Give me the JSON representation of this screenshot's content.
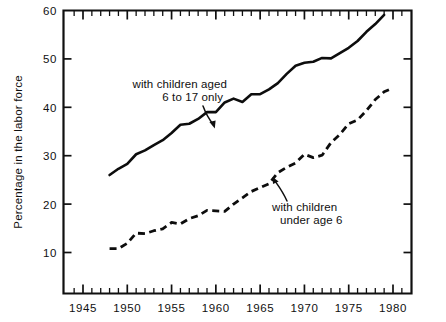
{
  "chart_data": {
    "type": "line",
    "title": "",
    "xlabel": "",
    "ylabel": "Percentage in the labor force",
    "xlim": [
      1943,
      1982
    ],
    "ylim": [
      4,
      60
    ],
    "grid": false,
    "legend_position": "inline-annotations",
    "x_ticks_major": [
      "1945",
      "1950",
      "1955",
      "1960",
      "1965",
      "1970",
      "1975",
      "1980"
    ],
    "y_ticks_major": [
      "10",
      "20",
      "30",
      "40",
      "50",
      "60"
    ],
    "x_tick_interval_minor": 1,
    "series": [
      {
        "name": "with children aged 6 to 17 only",
        "style": "solid",
        "annotation": {
          "line1": "with children aged",
          "line2": "6 to 17 only"
        },
        "x": [
          1948,
          1949,
          1950,
          1951,
          1952,
          1953,
          1954,
          1955,
          1956,
          1957,
          1958,
          1959,
          1960,
          1961,
          1962,
          1963,
          1964,
          1965,
          1966,
          1967,
          1968,
          1969,
          1970,
          1971,
          1972,
          1973,
          1974,
          1975,
          1976,
          1977,
          1978,
          1979
        ],
        "y": [
          26.0,
          27.3,
          28.3,
          30.3,
          31.1,
          32.2,
          33.2,
          34.7,
          36.4,
          36.6,
          37.6,
          39.0,
          39.0,
          41.0,
          41.8,
          41.1,
          42.7,
          42.7,
          43.7,
          45.0,
          46.9,
          48.6,
          49.2,
          49.4,
          50.2,
          50.1,
          51.2,
          52.3,
          53.7,
          55.6,
          57.2,
          59.1
        ]
      },
      {
        "name": "with children under age 6",
        "style": "dashed",
        "annotation": {
          "line1": "with children",
          "line2": "under age 6"
        },
        "x": [
          1948,
          1949,
          1950,
          1951,
          1952,
          1953,
          1954,
          1955,
          1956,
          1957,
          1958,
          1959,
          1960,
          1961,
          1962,
          1963,
          1964,
          1965,
          1966,
          1967,
          1968,
          1969,
          1970,
          1971,
          1972,
          1973,
          1974,
          1975,
          1976,
          1977,
          1978,
          1979,
          1980
        ],
        "y": [
          10.8,
          10.8,
          11.9,
          14.0,
          13.9,
          14.5,
          14.9,
          16.2,
          15.9,
          17.0,
          17.6,
          18.7,
          18.6,
          18.5,
          20.0,
          21.3,
          22.6,
          23.4,
          24.2,
          26.5,
          27.6,
          28.5,
          30.3,
          29.6,
          30.1,
          32.7,
          34.4,
          36.6,
          37.4,
          39.3,
          41.6,
          43.2,
          44.0
        ]
      }
    ]
  }
}
